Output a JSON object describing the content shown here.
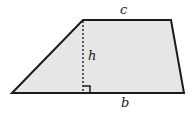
{
  "figure": {
    "name": "trapezoid-with-height",
    "shape_type": "trapezoid",
    "background_color": "#ffffff",
    "fill_color": "#e6e6e6",
    "stroke_color": "#1b1b1b",
    "stroke_width": 2,
    "dashed_stroke_color": "#1b1b1b",
    "dashed_stroke_width": 1.4,
    "dash_pattern": "2,2",
    "vertices": {
      "bottom_left": {
        "x": 12,
        "y": 93
      },
      "top_left": {
        "x": 83,
        "y": 20
      },
      "top_right": {
        "x": 171,
        "y": 20
      },
      "bottom_right": {
        "x": 184,
        "y": 93
      }
    },
    "height_segment": {
      "name": "height-dashed-line",
      "x": 83,
      "y_top": 20,
      "y_bottom": 93
    },
    "right_angle_marker": {
      "name": "right-angle-marker",
      "x": 83,
      "y": 93,
      "size": 7,
      "opens": "right"
    },
    "labels": {
      "top_side": "c",
      "height": "h",
      "bottom_side": "b"
    }
  }
}
